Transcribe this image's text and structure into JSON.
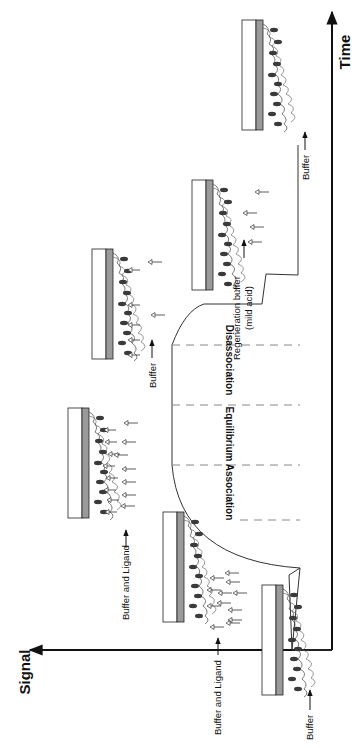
{
  "axes": {
    "signal_label": "Signal",
    "time_label": "Time"
  },
  "phases": [
    {
      "label": "Association"
    },
    {
      "label": "Equilibrium"
    },
    {
      "label": "Disassociation"
    }
  ],
  "injections": [
    {
      "label": "Buffer"
    },
    {
      "label": "Buffer and Ligand"
    },
    {
      "label": "Buffer and Ligand"
    },
    {
      "label": "Buffer"
    },
    {
      "label": "Regeneration buffer",
      "sublabel": "(mild acid)"
    },
    {
      "label": "Buffer"
    }
  ],
  "colors": {
    "axis": "#111111",
    "trace": "#333333",
    "chip_glass": "#ffffff",
    "chip_gold": "#9a9a9a",
    "receptor": "#3a3a3a",
    "dashed": "#888888"
  }
}
